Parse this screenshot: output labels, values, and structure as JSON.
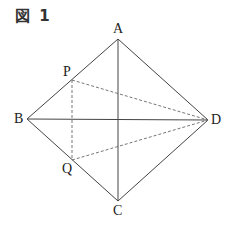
{
  "figure": {
    "title": "図 1",
    "labels": {
      "A": "A",
      "B": "B",
      "C": "C",
      "D": "D",
      "P": "P",
      "Q": "Q"
    },
    "points": {
      "A": [
        118,
        39
      ],
      "B": [
        27,
        119
      ],
      "C": [
        118,
        201
      ],
      "D": [
        208,
        120
      ],
      "P": [
        72,
        80
      ],
      "Q": [
        72,
        160
      ]
    },
    "solid_lines": [
      [
        "A",
        "B"
      ],
      [
        "B",
        "C"
      ],
      [
        "C",
        "D"
      ],
      [
        "D",
        "A"
      ],
      [
        "A",
        "C"
      ],
      [
        "B",
        "D"
      ]
    ],
    "dashed_lines": [
      [
        "P",
        "Q"
      ],
      [
        "P",
        "D"
      ],
      [
        "Q",
        "D"
      ]
    ],
    "line_color": "#444444"
  }
}
